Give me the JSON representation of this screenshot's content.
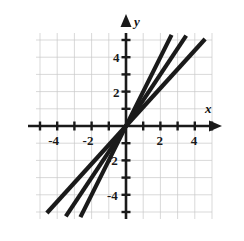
{
  "chart_data": {
    "type": "line",
    "title": "",
    "subtitle": "",
    "xlabel": "x",
    "ylabel": "y",
    "xlim": [
      -5.3,
      5.3
    ],
    "ylim": [
      -5.5,
      5.5
    ],
    "grid": true,
    "grid_step": 1,
    "legend": "none",
    "axis_origin": [
      0,
      0
    ],
    "x_ticks": [
      -5,
      -4,
      -3,
      -2,
      -1,
      1,
      2,
      3,
      4,
      5
    ],
    "y_ticks": [
      -5,
      -4,
      -3,
      -2,
      -1,
      1,
      2,
      3,
      4,
      5
    ],
    "x_tick_labels": [
      {
        "value": -4,
        "text": "-4"
      },
      {
        "value": -2,
        "text": "-2"
      },
      {
        "value": 2,
        "text": "2"
      },
      {
        "value": 4,
        "text": "4"
      }
    ],
    "y_tick_labels": [
      {
        "value": 4,
        "text": "4"
      },
      {
        "value": 2,
        "text": "2"
      },
      {
        "value": -2,
        "text": "-2"
      },
      {
        "value": -4,
        "text": "-4"
      }
    ],
    "series": [
      {
        "name": "line-steep",
        "slope": 2,
        "intercept": 0,
        "equation": "y = 2x",
        "color": "#1a1a1a",
        "points": [
          [
            -2.65,
            -5.3
          ],
          [
            2.65,
            5.3
          ]
        ]
      },
      {
        "name": "line-middle",
        "slope": 1.5,
        "intercept": 0,
        "equation": "y = 1.5x",
        "color": "#1a1a1a",
        "points": [
          [
            -3.5,
            -5.25
          ],
          [
            3.5,
            5.25
          ]
        ]
      },
      {
        "name": "line-shallow",
        "slope": 1.1,
        "intercept": 0,
        "equation": "y = 1.1x",
        "color": "#1a1a1a",
        "points": [
          [
            -4.6,
            -5.06
          ],
          [
            4.6,
            5.06
          ]
        ]
      }
    ],
    "colors": {
      "line": "#1a1a1a",
      "axis": "#1a1a1a",
      "grid": "#c8c8c8",
      "label": "#1a1a1a",
      "background": "#ffffff"
    }
  }
}
